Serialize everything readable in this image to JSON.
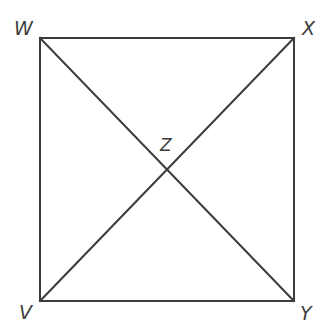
{
  "figure": {
    "name": "square-with-diagonals",
    "background_color": "#ffffff",
    "stroke_color": "#3c3c3c",
    "label_color": "#3c3c3c",
    "stroke_width": 2,
    "square": {
      "left": 40,
      "top": 38,
      "right": 294,
      "bottom": 301
    },
    "vertices": [
      {
        "id": "W",
        "label": "W",
        "corner": "top-left",
        "x": 40,
        "y": 38
      },
      {
        "id": "X",
        "label": "X",
        "corner": "top-right",
        "x": 294,
        "y": 38
      },
      {
        "id": "Y",
        "label": "Y",
        "corner": "bottom-right",
        "x": 294,
        "y": 301
      },
      {
        "id": "V",
        "label": "V",
        "corner": "bottom-left",
        "x": 40,
        "y": 301
      }
    ],
    "intersection": {
      "id": "Z",
      "label": "Z",
      "x": 167,
      "y": 170
    },
    "edges": [
      {
        "name": "top-edge",
        "from": "W",
        "to": "X"
      },
      {
        "name": "right-edge",
        "from": "X",
        "to": "Y"
      },
      {
        "name": "bottom-edge",
        "from": "V",
        "to": "Y"
      },
      {
        "name": "left-edge",
        "from": "W",
        "to": "V"
      }
    ],
    "diagonals": [
      {
        "name": "diagonal-w-y",
        "from": "W",
        "to": "Y"
      },
      {
        "name": "diagonal-v-x",
        "from": "V",
        "to": "X"
      }
    ]
  }
}
